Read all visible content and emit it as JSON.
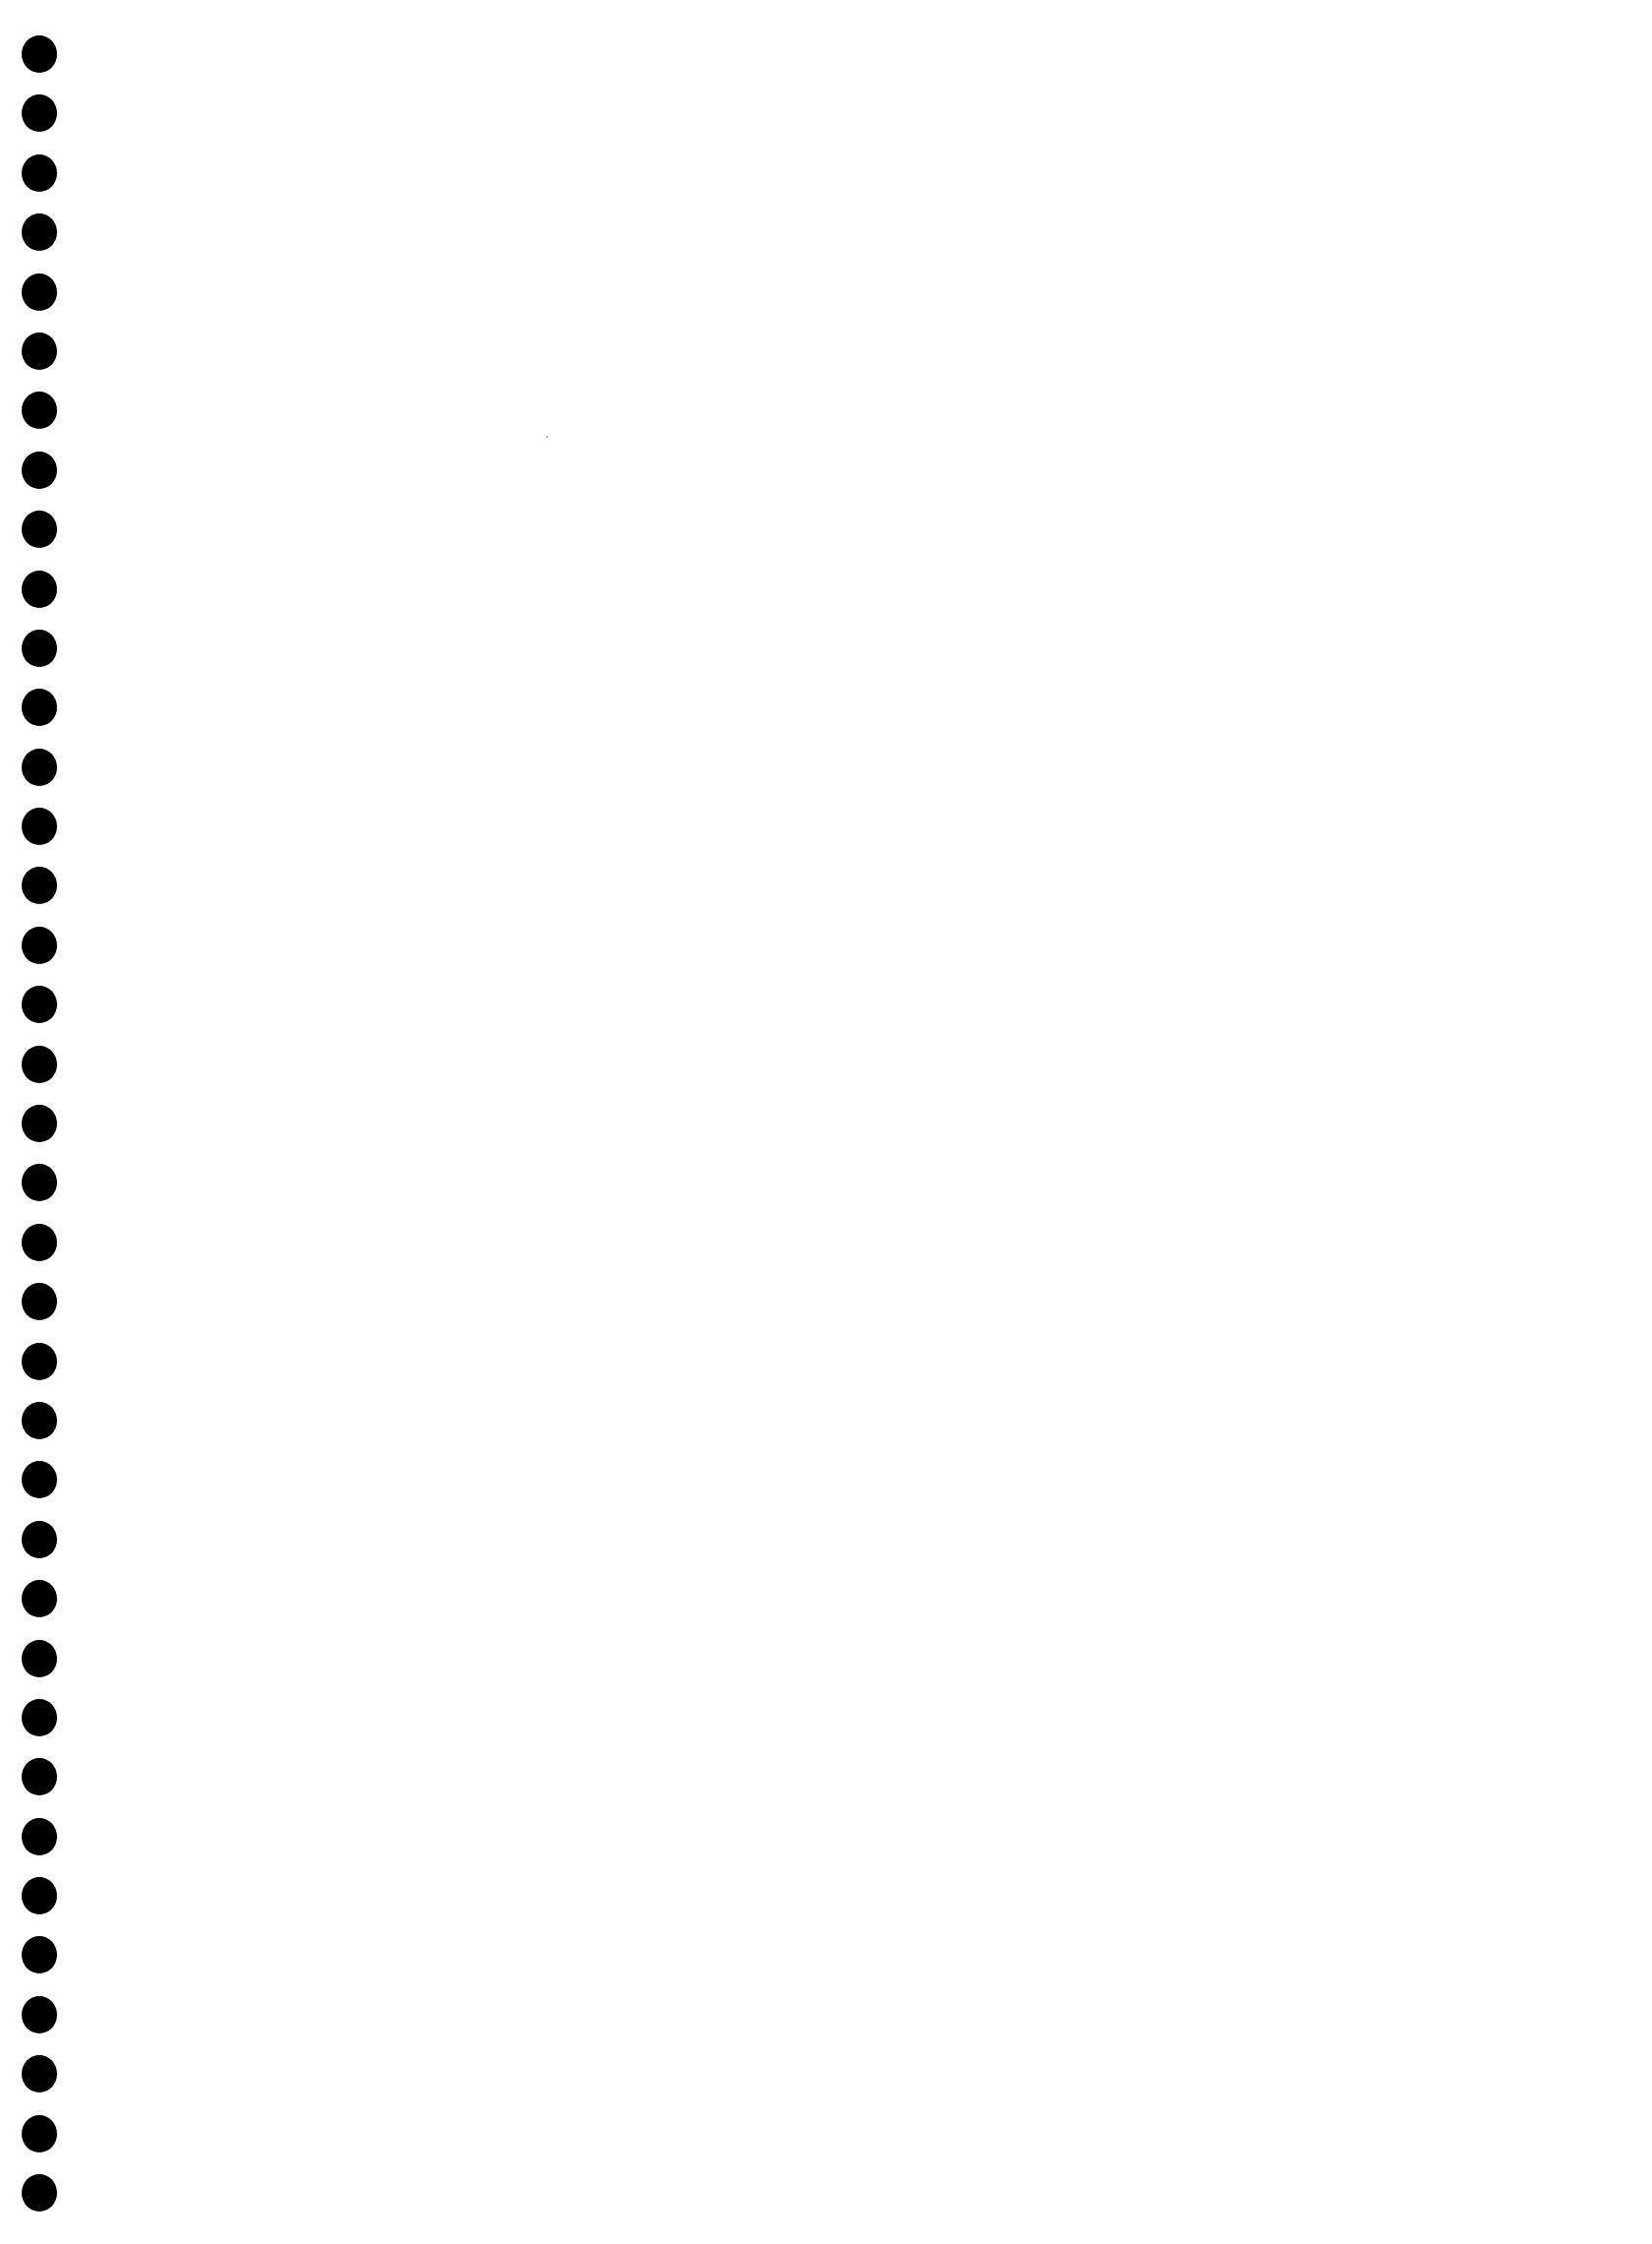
{
  "page": {
    "type": "blank-scanned-sheet",
    "background_color": "#ffffff",
    "binding_holes": {
      "count": 37,
      "color": "#000000",
      "first_center_y": 55,
      "last_center_y": 2229,
      "center_x": 40,
      "diameter": 37
    }
  }
}
